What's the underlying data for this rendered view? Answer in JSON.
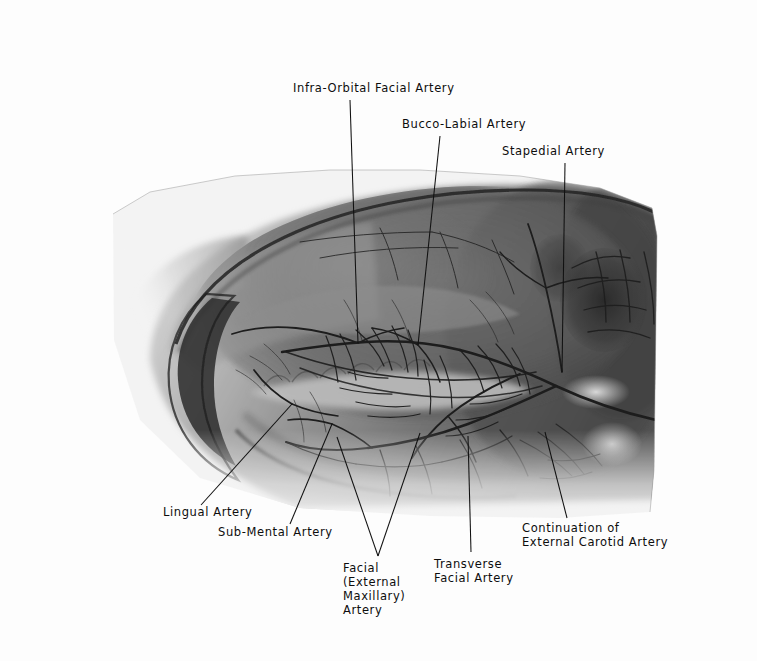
{
  "figure": {
    "type": "radiograph-angiogram",
    "background_color": "#fdfdfd",
    "film": {
      "description": "grayscale radiograph of a lateral view of a rodent head showing the opacified arterial tree",
      "left": 112,
      "top": 168,
      "right": 658,
      "bottom": 520,
      "tone_dark": "#2b2b2b",
      "tone_mid": "#7c7c7c",
      "tone_light": "#d8d8d8"
    },
    "annotations": [
      {
        "id": "infra-orbital-facial-artery",
        "text": "Infra-Orbital Facial Artery",
        "lines": [
          "Infra-Orbital Facial Artery"
        ],
        "text_x": 293,
        "text_y": 92,
        "anchor": "start",
        "leaders": [
          {
            "x1": 350,
            "y1": 100,
            "x2": 358,
            "y2": 343
          }
        ]
      },
      {
        "id": "bucco-labial-artery",
        "text": "Bucco-Labial Artery",
        "lines": [
          "Bucco-Labial Artery"
        ],
        "text_x": 402,
        "text_y": 128,
        "anchor": "start",
        "leaders": [
          {
            "x1": 440,
            "y1": 136,
            "x2": 418,
            "y2": 345
          }
        ]
      },
      {
        "id": "stapedial-artery",
        "text": "Stapedial Artery",
        "lines": [
          "Stapedial Artery"
        ],
        "text_x": 502,
        "text_y": 155,
        "anchor": "start",
        "leaders": [
          {
            "x1": 565,
            "y1": 163,
            "x2": 562,
            "y2": 372
          }
        ]
      },
      {
        "id": "lingual-artery",
        "text": "Lingual Artery",
        "lines": [
          "Lingual Artery"
        ],
        "text_x": 163,
        "text_y": 516,
        "anchor": "start",
        "leaders": [
          {
            "x1": 201,
            "y1": 505,
            "x2": 292,
            "y2": 404
          }
        ]
      },
      {
        "id": "sub-mental-artery",
        "text": "Sub-Mental Artery",
        "lines": [
          "Sub-Mental Artery"
        ],
        "text_x": 218,
        "text_y": 536,
        "anchor": "start",
        "leaders": [
          {
            "x1": 290,
            "y1": 524,
            "x2": 332,
            "y2": 424
          }
        ]
      },
      {
        "id": "facial-external-maxillary-artery",
        "text": "Facial (External Maxillary) Artery",
        "lines": [
          "Facial",
          "(External",
          "Maxillary)",
          "Artery"
        ],
        "text_x": 343,
        "text_y": 572,
        "anchor": "start",
        "leaders": [
          {
            "x1": 378,
            "y1": 556,
            "x2": 337,
            "y2": 437
          },
          {
            "x1": 378,
            "y1": 556,
            "x2": 420,
            "y2": 433
          }
        ]
      },
      {
        "id": "transverse-facial-artery",
        "text": "Transverse Facial Artery",
        "lines": [
          "Transverse",
          "Facial Artery"
        ],
        "text_x": 434,
        "text_y": 568,
        "anchor": "start",
        "leaders": [
          {
            "x1": 471,
            "y1": 552,
            "x2": 468,
            "y2": 436
          }
        ]
      },
      {
        "id": "continuation-of-external-carotid-artery",
        "text": "Continuation of External Carotid Artery",
        "lines": [
          "Continuation of",
          "External Carotid Artery"
        ],
        "text_x": 522,
        "text_y": 532,
        "anchor": "start",
        "leaders": [
          {
            "x1": 567,
            "y1": 518,
            "x2": 545,
            "y2": 432
          }
        ]
      }
    ]
  }
}
